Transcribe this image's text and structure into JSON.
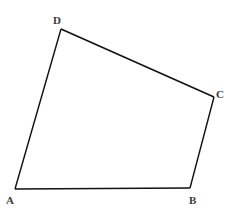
{
  "diagram": {
    "type": "quadrilateral",
    "stroke_color": "#111111",
    "label_color": "#3a3a3a",
    "vertices": [
      {
        "name": "A",
        "x": 15,
        "y": 189,
        "label_x": 6,
        "label_y": 204
      },
      {
        "name": "B",
        "x": 190,
        "y": 188,
        "label_x": 189,
        "label_y": 204
      },
      {
        "name": "C",
        "x": 214,
        "y": 97,
        "label_x": 216,
        "label_y": 98
      },
      {
        "name": "D",
        "x": 61,
        "y": 29,
        "label_x": 53,
        "label_y": 24
      }
    ],
    "edges": [
      {
        "from": "A",
        "to": "B"
      },
      {
        "from": "B",
        "to": "C"
      },
      {
        "from": "C",
        "to": "D"
      },
      {
        "from": "D",
        "to": "A"
      }
    ]
  }
}
